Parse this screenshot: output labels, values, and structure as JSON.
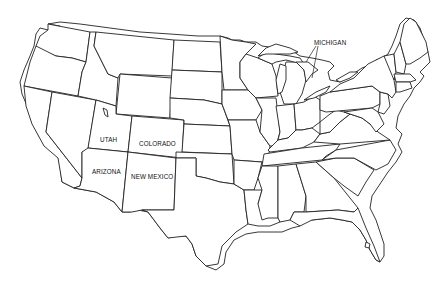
{
  "map": {
    "type": "outline map of the contiguous United States",
    "background": "#ffffff",
    "stroke_color": "#222222",
    "labels": [
      {
        "id": "michigan",
        "text": "MICHIGAN"
      },
      {
        "id": "utah",
        "text": "UTAH"
      },
      {
        "id": "colorado",
        "text": "COLORADO"
      },
      {
        "id": "arizona",
        "text": "ARIZONA"
      },
      {
        "id": "new_mexico",
        "text": "NEW MEXICO"
      }
    ]
  }
}
